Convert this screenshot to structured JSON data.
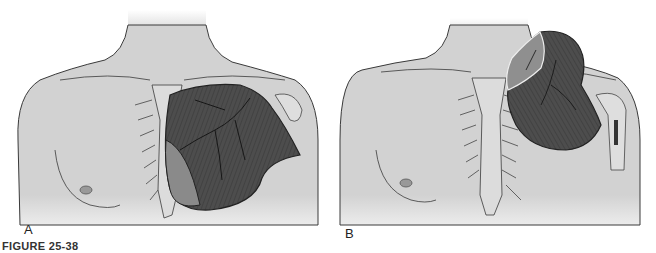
{
  "figure": {
    "caption": "FIGURE 25-38",
    "panels": [
      {
        "id": "A",
        "label": "A",
        "description": "Anterior chest with pectoralis major muscle in situ over right chest"
      },
      {
        "id": "B",
        "label": "B",
        "description": "Anterior chest with pectoralis major muscle reflected toward shoulder"
      }
    ],
    "colors": {
      "background": "#ffffff",
      "skin": "#d2d2d2",
      "outline": "#3a3a3a",
      "muscle": "#4d4d4d",
      "muscle_dark": "#383838",
      "muscle_light": "#8a8a8a"
    }
  }
}
